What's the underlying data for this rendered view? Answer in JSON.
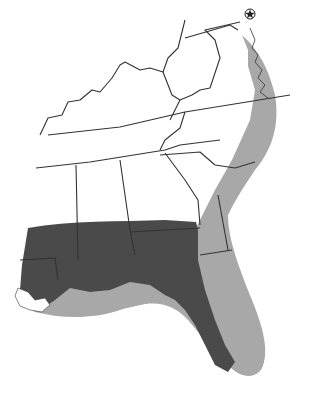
{
  "map": {
    "region": "Southeastern United States",
    "colors": {
      "background": "#ffffff",
      "land_unshaded": "#ffffff",
      "land_dark_zone": "#4a4a4a",
      "coastal_band": "#a8a8a8",
      "borders": "#333333"
    },
    "legend_zones": [
      {
        "name": "dark-shaded-zone",
        "color": "#4a4a4a"
      },
      {
        "name": "light-shaded-coastal-zone",
        "color": "#a8a8a8"
      }
    ],
    "marker": {
      "name": "capital-star",
      "symbol": "star-in-circle"
    }
  },
  "caption": {
    "text": ""
  }
}
